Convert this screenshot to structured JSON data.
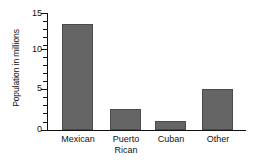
{
  "chart_data": {
    "type": "bar",
    "title": "",
    "xlabel": "",
    "ylabel": "Population in millions",
    "categories": [
      "Mexican",
      "Puerto\nRican",
      "Cuban",
      "Other"
    ],
    "values": [
      13.6,
      2.7,
      1.1,
      5.2
    ],
    "ylim": [
      0,
      15
    ],
    "yticks": [
      0,
      5,
      10,
      15
    ],
    "ytick_labels": [
      "0",
      "5",
      "10",
      "15"
    ],
    "minor_tick_step": 1,
    "grid": false,
    "legend": false,
    "bar_color": "#656565",
    "axis_color": "#111111"
  }
}
